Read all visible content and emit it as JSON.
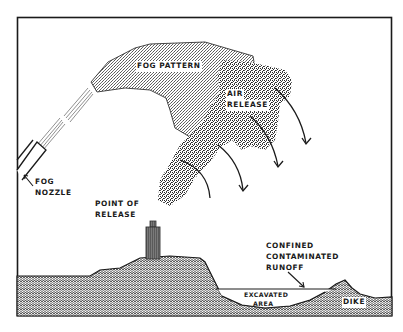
{
  "diagram": {
    "colors": {
      "ink": "#1a1a1a",
      "background": "#ffffff",
      "fog_fill": "#c8c8c8",
      "cloud_fill": "#8a8a8a",
      "cylinder_fill": "#6e6e6e"
    },
    "labels": {
      "fog_pattern": "FOG PATTERN",
      "air_release_line1": "AIR",
      "air_release_line2": "RELEASE",
      "fog_nozzle_line1": "FOG",
      "fog_nozzle_line2": "NOZZLE",
      "point_of_release_line1": "POINT OF",
      "point_of_release_line2": "RELEASE",
      "runoff_line1": "CONFINED",
      "runoff_line2": "CONTAMINATED",
      "runoff_line3": "RUNOFF",
      "excavated_line1": "EXCAVATED",
      "excavated_line2": "AREA",
      "dike": "DIKE"
    },
    "elements": [
      {
        "id": "fog-nozzle",
        "label": "FOG NOZZLE",
        "position": "lower-left, angled up-right"
      },
      {
        "id": "fog-pattern",
        "label": "FOG PATTERN",
        "position": "top-center spray arc"
      },
      {
        "id": "air-release",
        "label": "AIR RELEASE",
        "position": "center-right cloud with 4 downward arrows"
      },
      {
        "id": "point-of-release",
        "label": "POINT OF RELEASE",
        "position": "gas cylinder on hill"
      },
      {
        "id": "runoff",
        "label": "CONFINED CONTAMINATED RUNOFF",
        "position": "right, arrow to water line"
      },
      {
        "id": "excavated-area",
        "label": "EXCAVATED AREA",
        "position": "bottom-right depression"
      },
      {
        "id": "dike",
        "label": "DIKE",
        "position": "bottom-right mound"
      }
    ]
  }
}
